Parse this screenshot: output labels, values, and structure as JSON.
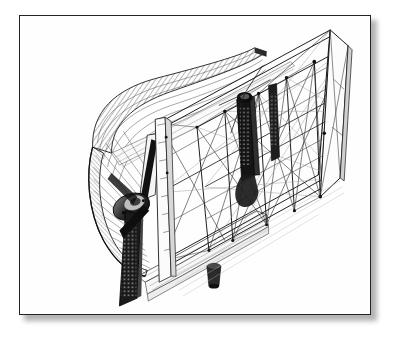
{
  "page": {
    "background_color": "#ffffff",
    "width": 394,
    "height": 342
  },
  "frame": {
    "name": "picture-frame",
    "border_color": "#232323",
    "border_width_px": 1.6,
    "fill_color": "#ffffff",
    "shadow_color": "rgba(0,0,0,0.30)",
    "left": 19,
    "top": 15,
    "width": 352,
    "height": 300
  },
  "illustration": {
    "title": "",
    "caption": "",
    "style": "wireframe line drawing",
    "line_color": "#1a1a1a",
    "hatch_color": "#3a3a3a",
    "fill_light": "#f2f2f2",
    "fill_dark": "#141414",
    "view": "three-quarter isometric",
    "parts": [
      {
        "id": "duct-cowling",
        "label": "curved duct cowling",
        "shading": "hatched"
      },
      {
        "id": "fan-ring",
        "label": "fan intake ring",
        "shading": "hatched"
      },
      {
        "id": "propeller-hub",
        "label": "propeller hub / bearing boss",
        "shading": "dark solid"
      },
      {
        "id": "blade-upper",
        "label": "upper fan blade",
        "shading": "dark solid"
      },
      {
        "id": "blade-lower",
        "label": "lower fan blade",
        "shading": "dark perforated"
      },
      {
        "id": "mast-vertical",
        "label": "central vertical mast",
        "shading": "dark solid"
      },
      {
        "id": "truss-bay-1",
        "label": "lattice truss bay 1",
        "shading": "outline"
      },
      {
        "id": "truss-bay-2",
        "label": "lattice truss bay 2",
        "shading": "outline"
      },
      {
        "id": "truss-bay-3",
        "label": "lattice truss bay 3",
        "shading": "outline"
      },
      {
        "id": "end-frame",
        "label": "far end rail frame",
        "shading": "outline"
      },
      {
        "id": "deck-platform",
        "label": "lower deck platform",
        "shading": "hatched"
      },
      {
        "id": "base-cylinder",
        "label": "base cylinder / footing",
        "shading": "dark solid"
      },
      {
        "id": "diagonal-bracing",
        "label": "diagonal cross bracing",
        "shading": "outline"
      },
      {
        "id": "node-joints",
        "label": "node joint markers",
        "shading": "dark dots"
      }
    ]
  }
}
